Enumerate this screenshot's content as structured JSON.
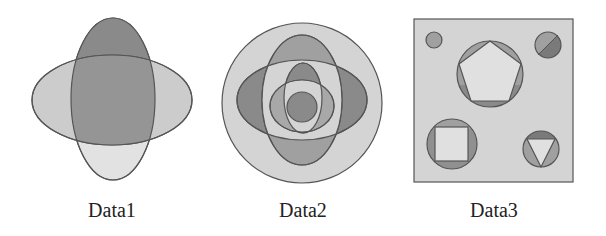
{
  "figure": {
    "panels": [
      {
        "id": "data1",
        "label": "Data1",
        "description": "Two overlapping ellipses (vertical and horizontal) forming four-lobed shape"
      },
      {
        "id": "data2",
        "label": "Data2",
        "description": "Outer circle containing nested crossed ellipses and center circle"
      },
      {
        "id": "data3",
        "label": "Data3",
        "description": "Square containing circles with inscribed pentagon, square, triangle, a split circle and a small circle"
      }
    ]
  },
  "colors": {
    "outline": "#555555",
    "dark": "#8a8a8a",
    "medium": "#a8a8a8",
    "light": "#cccccc",
    "lighter": "#e2e2e2",
    "overlap": "#959595"
  }
}
